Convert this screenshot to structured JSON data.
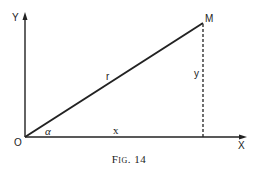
{
  "figure": {
    "caption": "Fig. 14",
    "labels": {
      "y_axis": "Y",
      "x_axis": "X",
      "origin": "O",
      "point": "M",
      "radius": "r",
      "y_segment": "y",
      "x_segment": "x",
      "angle": "α"
    },
    "colors": {
      "line": "#222222",
      "background": "#ffffff"
    }
  }
}
